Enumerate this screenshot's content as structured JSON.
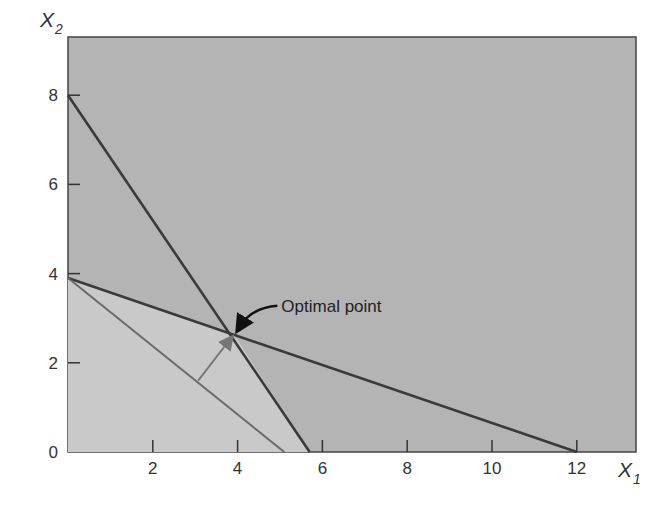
{
  "chart_data": {
    "type": "line",
    "title": "",
    "xlabel": "X",
    "xlabel_sub": "1",
    "ylabel": "X",
    "ylabel_sub": "2",
    "xlim": [
      0,
      13.2
    ],
    "ylim": [
      0,
      9.3
    ],
    "x_ticks": [
      2,
      4,
      6,
      8,
      10,
      12
    ],
    "y_ticks": [
      0,
      2,
      4,
      6,
      8
    ],
    "x_tick_labels": [
      "2",
      "4",
      "6",
      "8",
      "10",
      "12"
    ],
    "y_tick_labels": [
      "0",
      "2",
      "4",
      "6",
      "8"
    ],
    "grid": false,
    "legend": null,
    "series": [
      {
        "name": "Constraint 1",
        "points": [
          [
            0,
            8
          ],
          [
            5.7,
            0
          ]
        ],
        "color": "#3a3a3a"
      },
      {
        "name": "Constraint 2",
        "points": [
          [
            0,
            3.9
          ],
          [
            12,
            0
          ]
        ],
        "color": "#3a3a3a"
      },
      {
        "name": "Objective function line",
        "points": [
          [
            0,
            3.9
          ],
          [
            5.1,
            0
          ]
        ],
        "color": "#6a6a6a"
      }
    ],
    "feasible_region": [
      [
        0,
        0
      ],
      [
        0,
        3.9
      ],
      [
        3.9,
        2.65
      ],
      [
        5.7,
        0
      ]
    ],
    "optimal_point": [
      3.9,
      2.65
    ],
    "annotations": [
      {
        "text": "Optimal point",
        "x": 3.9,
        "y": 2.65
      }
    ],
    "objective_direction_arrow": {
      "from": [
        3.07,
        1.6
      ],
      "to": [
        3.8,
        2.5
      ]
    },
    "colors": {
      "background_region": "#b4b4b4",
      "feasible_region": "#c9c9c9",
      "axis": "#333333"
    }
  }
}
